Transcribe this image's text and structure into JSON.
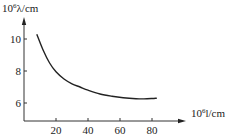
{
  "chart_data": {
    "type": "line",
    "title": "",
    "xlabel": "10⁶l/cm",
    "ylabel": "10⁶λ/cm",
    "xlabel_parts": {
      "base": "10",
      "exp": "6",
      "rest": "l/cm"
    },
    "ylabel_parts": {
      "base": "10",
      "exp": "6",
      "rest": "λ/cm"
    },
    "x_ticks": [
      20,
      40,
      60,
      80
    ],
    "y_ticks": [
      6,
      8,
      10
    ],
    "xlim": [
      0,
      100
    ],
    "ylim": [
      4.9,
      11.5
    ],
    "grid": false,
    "legend": null,
    "series": [
      {
        "name": "λ vs l",
        "color": "#222222",
        "x": [
          8,
          12,
          16,
          20,
          25,
          30,
          35,
          40,
          47.5,
          55,
          62,
          70,
          75,
          80,
          83
        ],
        "y": [
          10.3,
          9.3,
          8.5,
          7.95,
          7.5,
          7.2,
          7.0,
          6.8,
          6.56,
          6.42,
          6.33,
          6.27,
          6.26,
          6.28,
          6.3
        ]
      }
    ]
  },
  "layout": {
    "origin_px": {
      "x": 24,
      "y": 121
    },
    "x_scale_px_per_unit": 1.6,
    "y_ref_value": 6,
    "y_ref_px": 103,
    "y_scale_px_per_unit": 16,
    "x_axis_end_px": 186,
    "y_axis_top_px": 17
  }
}
